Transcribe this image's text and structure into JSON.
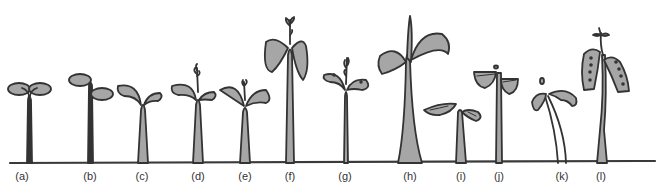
{
  "figure": {
    "colors": {
      "outline": "#333333",
      "fill": "#a6a6a6",
      "ground": "#3a3a3a",
      "background": "#ffffff"
    },
    "seedlings": [
      {
        "label": "(a)",
        "x": 22
      },
      {
        "label": "(b)",
        "x": 90
      },
      {
        "label": "(c)",
        "x": 142
      },
      {
        "label": "(d)",
        "x": 198
      },
      {
        "label": "(e)",
        "x": 245
      },
      {
        "label": "(f)",
        "x": 290
      },
      {
        "label": "(g)",
        "x": 345
      },
      {
        "label": "(h)",
        "x": 410
      },
      {
        "label": "(i)",
        "x": 461
      },
      {
        "label": "(j)",
        "x": 499
      },
      {
        "label": "(k)",
        "x": 562
      },
      {
        "label": "(l)",
        "x": 601
      }
    ]
  }
}
